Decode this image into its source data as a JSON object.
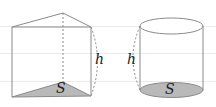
{
  "figure": {
    "colors": {
      "background": "#ffffff",
      "gridline": "#ececec",
      "edge": "#8a8a8a",
      "base_fill": "#b9b9b9",
      "dashed": "#8a8a8a",
      "text": "#222222"
    },
    "prism": {
      "name": "triangular prism",
      "base_label": "S",
      "height_label": "h"
    },
    "cylinder": {
      "name": "cylinder",
      "base_label": "S",
      "height_label": "h"
    }
  }
}
